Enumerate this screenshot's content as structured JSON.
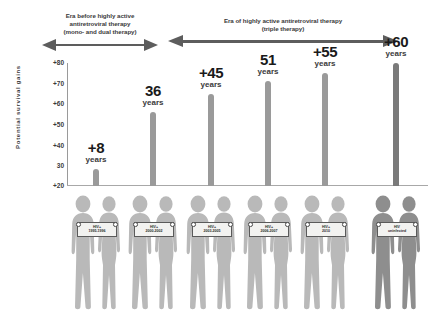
{
  "eras": [
    {
      "name": "era-pre-haart",
      "line1": "Era before highly active",
      "line2": "antiretroviral therapy",
      "line3": "(mono- and dual therapy)"
    },
    {
      "name": "era-haart",
      "line1": "Era of highly active antiretroviral therapy",
      "line2": "(triple therapy)",
      "line3": ""
    }
  ],
  "axis": {
    "title": "Potential survival gains",
    "ticks": [
      "+80",
      "+70",
      "+60",
      "+50",
      "+40",
      "30",
      "+20"
    ]
  },
  "colors": {
    "bar_hiv": "#9a9a9a",
    "bar_uninfected": "#7a7a7a",
    "figure_light": "#b9b9b9",
    "figure_dark": "#8e8e8e",
    "arrow": "#5d5d5d",
    "text": "#1a1a1a"
  },
  "chart_data": {
    "type": "bar",
    "xlabel": "",
    "ylabel": "Potential survival gains",
    "ylim": [
      20,
      80
    ],
    "yticks": [
      20,
      30,
      40,
      50,
      60,
      70,
      80
    ],
    "grid": false,
    "legend": "none",
    "baseline": 20,
    "categories": [
      "HIV+ 1995-1996",
      "HIV+ 2000-2002",
      "HIV+ 2003-2005",
      "HIV+ 2006-2007",
      "HIV+ 2010",
      "HIV uninfected"
    ],
    "values": [
      28,
      56,
      65,
      71,
      75,
      80
    ],
    "data_labels": [
      "+8",
      "36",
      "+45",
      "51",
      "+55",
      "+60"
    ],
    "data_label_unit": "years"
  },
  "bars": [
    {
      "name": "bar-1995-1996",
      "label_number": "+8",
      "label_unit": "years",
      "sign_line1": "HIV+",
      "sign_line2": "1995-1996",
      "value": 28
    },
    {
      "name": "bar-2000-2002",
      "label_number": "36",
      "label_unit": "years",
      "sign_line1": "HIV+",
      "sign_line2": "2000-2002",
      "value": 56
    },
    {
      "name": "bar-2003-2005",
      "label_number": "+45",
      "label_unit": "years",
      "sign_line1": "HIV+",
      "sign_line2": "2003-2005",
      "value": 65
    },
    {
      "name": "bar-2006-2007",
      "label_number": "51",
      "label_unit": "years",
      "sign_line1": "HIV+",
      "sign_line2": "2006-2007",
      "value": 71
    },
    {
      "name": "bar-2010",
      "label_number": "+55",
      "label_unit": "years",
      "sign_line1": "HIV+",
      "sign_line2": "2010",
      "value": 75
    },
    {
      "name": "bar-uninfected",
      "label_number": "+60",
      "label_unit": "years",
      "sign_line1": "HIV",
      "sign_line2": "uninfected",
      "value": 80
    }
  ]
}
